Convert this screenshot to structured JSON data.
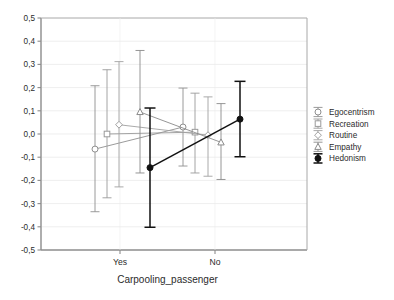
{
  "chart_data": {
    "type": "line",
    "title": "",
    "xlabel": "Carpooling_passenger",
    "ylabel": "",
    "categories": [
      "Yes",
      "No"
    ],
    "ylim": [
      -0.5,
      0.5
    ],
    "yticks": [
      "-0,5",
      "-0,4",
      "-0,3",
      "-0,2",
      "-0,1",
      "0,0",
      "0,1",
      "0,2",
      "0,3",
      "0,4",
      "0,5"
    ],
    "ytick_values": [
      -0.5,
      -0.4,
      -0.3,
      -0.2,
      -0.1,
      0.0,
      0.1,
      0.2,
      0.3,
      0.4,
      0.5
    ],
    "grid": true,
    "legend_position": "right",
    "error_bars": true,
    "series": [
      {
        "name": "Egocentrism",
        "marker": "circle",
        "color": "#8f8f8f",
        "values": [
          -0.065,
          0.03
        ],
        "err_low": [
          -0.335,
          -0.138
        ],
        "err_high": [
          0.208,
          0.198
        ]
      },
      {
        "name": "Recreation",
        "marker": "square",
        "color": "#9a9a9a",
        "values": [
          0.0,
          0.008
        ],
        "err_low": [
          -0.275,
          -0.168
        ],
        "err_high": [
          0.277,
          0.176
        ]
      },
      {
        "name": "Routine",
        "marker": "diamond",
        "color": "#a0a0a0",
        "values": [
          0.04,
          -0.005
        ],
        "err_low": [
          -0.228,
          -0.182
        ],
        "err_high": [
          0.312,
          0.16
        ]
      },
      {
        "name": "Empathy",
        "marker": "triangle",
        "color": "#8a8a8a",
        "values": [
          0.095,
          -0.036
        ],
        "err_low": [
          -0.168,
          -0.196
        ],
        "err_high": [
          0.36,
          0.131
        ]
      },
      {
        "name": "Hedonism",
        "marker": "filled-circle",
        "color": "#111111",
        "values": [
          -0.145,
          0.064
        ],
        "err_low": [
          -0.402,
          -0.098
        ],
        "err_high": [
          0.112,
          0.227
        ]
      }
    ]
  },
  "axes": {
    "x_categories": [
      "Yes",
      "No"
    ],
    "x_axis_title": "Carpooling_passenger"
  },
  "legend": {
    "items": [
      {
        "label": "Egocentrism"
      },
      {
        "label": "Recreation"
      },
      {
        "label": "Routine"
      },
      {
        "label": "Empathy"
      },
      {
        "label": "Hedonism"
      }
    ]
  }
}
